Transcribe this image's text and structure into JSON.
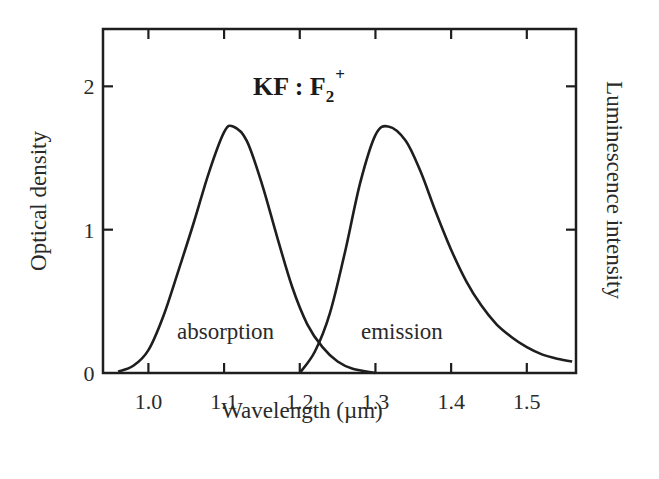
{
  "chart_data": {
    "type": "line",
    "title": "KF : F2+",
    "title_parts": {
      "main": "KF : F",
      "subscript": "2",
      "superscript": "+"
    },
    "xlabel": "Wavelength (µm)",
    "ylabel": "Optical density",
    "ylabel_right": "Luminescence intensity",
    "xlim": [
      0.94,
      1.565
    ],
    "ylim": [
      0,
      2.4
    ],
    "x_ticks": [
      "1.0",
      "1.1",
      "1.2",
      "1.3",
      "1.4",
      "1.5"
    ],
    "y_ticks": [
      "0",
      "1",
      "2"
    ],
    "grid": false,
    "legend": "none (curves labeled inline)",
    "annotations": [
      "absorption",
      "emission"
    ],
    "series": [
      {
        "name": "absorption",
        "label": "absorption",
        "x": [
          0.96,
          0.98,
          1.0,
          1.02,
          1.04,
          1.06,
          1.08,
          1.1,
          1.112,
          1.13,
          1.15,
          1.17,
          1.19,
          1.21,
          1.23,
          1.25,
          1.27,
          1.3
        ],
        "y": [
          0.01,
          0.05,
          0.16,
          0.4,
          0.72,
          1.05,
          1.4,
          1.68,
          1.72,
          1.62,
          1.32,
          0.95,
          0.6,
          0.34,
          0.18,
          0.08,
          0.03,
          0.0
        ]
      },
      {
        "name": "emission",
        "label": "emission",
        "x": [
          1.2,
          1.22,
          1.24,
          1.26,
          1.28,
          1.3,
          1.317,
          1.34,
          1.36,
          1.38,
          1.4,
          1.42,
          1.44,
          1.46,
          1.48,
          1.5,
          1.52,
          1.54,
          1.56
        ],
        "y": [
          0.0,
          0.15,
          0.42,
          0.85,
          1.33,
          1.66,
          1.72,
          1.62,
          1.4,
          1.12,
          0.86,
          0.64,
          0.47,
          0.34,
          0.25,
          0.18,
          0.13,
          0.1,
          0.08
        ]
      }
    ]
  },
  "labels": {
    "title_main": "KF : F",
    "title_sub": "2",
    "title_sup": "+",
    "xlabel": "Wavelength (µm)",
    "ylabel_left": "Optical density",
    "ylabel_right": "Luminescence intensity",
    "absorption": "absorption",
    "emission": "emission",
    "x_ticks": [
      "1.0",
      "1.1",
      "1.2",
      "1.3",
      "1.4",
      "1.5"
    ],
    "y_ticks": [
      "0",
      "1",
      "2"
    ]
  },
  "colors": {
    "line": "#1e1e1e",
    "background": "#ffffff"
  }
}
